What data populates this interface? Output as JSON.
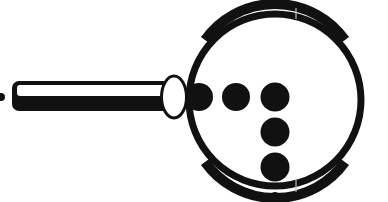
{
  "figure": {
    "title": "",
    "colors": {
      "ink": "#111111",
      "background": "#ffffff",
      "fill_light": "#ffffff"
    }
  },
  "magnifier": {
    "lens": {
      "cx": 275,
      "cy": 100,
      "r": 88,
      "stroke_width": 7
    },
    "collar": {
      "cx": 174,
      "cy": 97,
      "rx": 13,
      "ry": 21
    },
    "handle": {
      "x": 12,
      "y": 81,
      "width": 156,
      "height": 30
    },
    "handle_end_dot": {
      "cx": 1,
      "cy": 97,
      "r": 4
    }
  },
  "dots": [
    {
      "cx": 199,
      "cy": 97,
      "r": 13
    },
    {
      "cx": 236,
      "cy": 97,
      "r": 14
    },
    {
      "cx": 275,
      "cy": 97,
      "r": 14
    },
    {
      "cx": 275,
      "cy": 132,
      "r": 14
    },
    {
      "cx": 275,
      "cy": 167,
      "r": 14
    },
    {
      "cx": 275,
      "cy": 197,
      "r": 5
    }
  ]
}
